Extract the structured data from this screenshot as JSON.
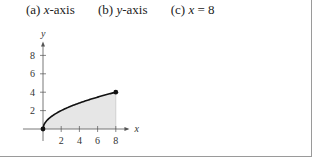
{
  "header": {
    "items": [
      {
        "prefix": "(a)",
        "var": "x",
        "suffix": "-axis"
      },
      {
        "prefix": "(b)",
        "var": "y",
        "suffix": "-axis"
      },
      {
        "prefix": "(c)",
        "var": "x",
        "suffix": " = 8"
      }
    ]
  },
  "colors": {
    "curve": "#111111",
    "fill": "#e6e6e6",
    "axis": "#555555",
    "border": "#9a9a9a"
  },
  "chart_data": {
    "type": "area",
    "title": "",
    "function": "y = sqrt(2x)",
    "xlabel": "x",
    "ylabel": "y",
    "xlim": [
      0,
      9
    ],
    "ylim": [
      0,
      9
    ],
    "x_ticks": [
      2,
      4,
      6,
      8
    ],
    "y_ticks": [
      2,
      4,
      6,
      8
    ],
    "x_tick_labels": [
      "2",
      "4",
      "6",
      "8"
    ],
    "y_tick_labels": [
      "2",
      "4",
      "6",
      "8"
    ],
    "series": [
      {
        "name": "y = sqrt(2x)",
        "x": [
          0,
          0.5,
          1,
          2,
          3,
          4,
          5,
          6,
          7,
          8
        ],
        "y": [
          0,
          1,
          1.41,
          2,
          2.45,
          2.83,
          3.16,
          3.46,
          3.74,
          4
        ]
      }
    ],
    "shaded_region": {
      "from_x": 0,
      "to_x": 8,
      "between": "curve and x-axis"
    },
    "endpoints": [
      {
        "x": 0,
        "y": 0
      },
      {
        "x": 8,
        "y": 4
      }
    ],
    "grid": false,
    "legend": "none"
  }
}
